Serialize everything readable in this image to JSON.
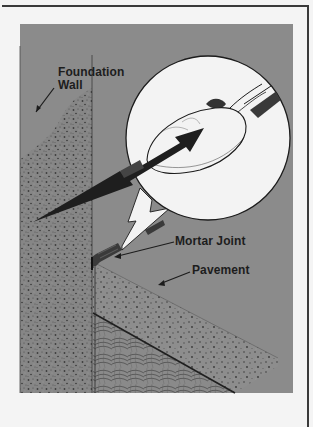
{
  "figure": {
    "type": "illustration",
    "colors": {
      "page_background": "#f4f4f4",
      "frame_line": "#3a3a3a",
      "panel_gray": "#8b8b8b",
      "concrete_gray": "#7d7d7d",
      "dark_arrow": "#1e1e1e",
      "inset_white": "#f3f3f3"
    }
  },
  "labels": {
    "foundation_wall_line1": "Foundation",
    "foundation_wall_line2": "Wall",
    "mortar_joint": "Mortar Joint",
    "pavement": "Pavement"
  },
  "parts": [
    {
      "name": "foundation-wall",
      "label": "Foundation Wall"
    },
    {
      "name": "mortar-joint",
      "label": "Mortar Joint"
    },
    {
      "name": "pavement",
      "label": "Pavement"
    },
    {
      "name": "magnified-inset",
      "label": ""
    },
    {
      "name": "pointing-tool-spoon",
      "label": ""
    },
    {
      "name": "soil",
      "label": ""
    }
  ]
}
